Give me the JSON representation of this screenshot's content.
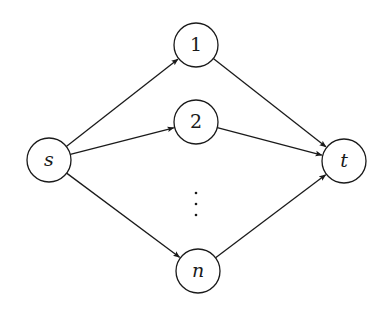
{
  "diagram": {
    "type": "directed-graph",
    "nodes": [
      {
        "id": "s",
        "label": "s",
        "italic": true,
        "x": 49,
        "y": 160
      },
      {
        "id": "1",
        "label": "1",
        "italic": false,
        "x": 196,
        "y": 45
      },
      {
        "id": "2",
        "label": "2",
        "italic": false,
        "x": 196,
        "y": 122
      },
      {
        "id": "n",
        "label": "n",
        "italic": true,
        "x": 198,
        "y": 271
      },
      {
        "id": "t",
        "label": "t",
        "italic": true,
        "x": 344,
        "y": 161
      }
    ],
    "edges": [
      {
        "from": "s",
        "to": "1"
      },
      {
        "from": "s",
        "to": "2"
      },
      {
        "from": "s",
        "to": "n"
      },
      {
        "from": "1",
        "to": "t"
      },
      {
        "from": "2",
        "to": "t"
      },
      {
        "from": "n",
        "to": "t"
      }
    ],
    "ellipsis": {
      "label": "vertical-dots",
      "x": 196,
      "y": [
        193,
        204,
        215
      ]
    },
    "node_radius": 22,
    "colors": {
      "stroke": "#1a1a1a",
      "fill": "#ffffff",
      "background": "#ffffff"
    }
  }
}
